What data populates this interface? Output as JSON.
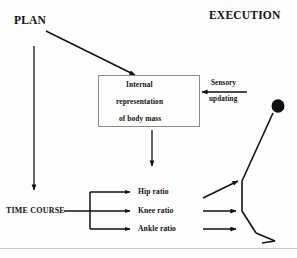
{
  "figure": {
    "headings": {
      "plan": "PLAN",
      "execution": "EXECUTION"
    },
    "internal_box": {
      "line1": "Internal",
      "line2": "representation",
      "line3": "of body mass"
    },
    "feedback": {
      "line1": "Sensory",
      "line2": "updating"
    },
    "time_course_label": "TIME COURSE",
    "ratios": [
      {
        "label": "Hip ratio"
      },
      {
        "label": "Knee ratio"
      },
      {
        "label": "Ankle ratio"
      }
    ],
    "colors": {
      "ink": "#111111",
      "box_border": "#8a8a8a",
      "rule": "#c9c9c9",
      "background": "#fefefe"
    }
  }
}
